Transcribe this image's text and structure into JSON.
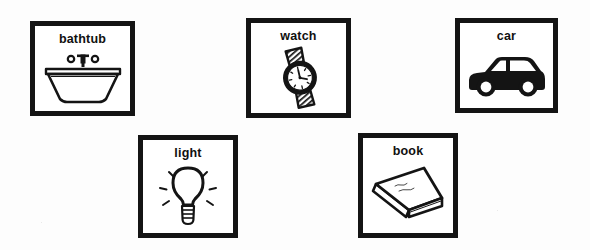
{
  "sheet": {
    "background_color": "#ffffff",
    "ink_color": "#141414",
    "description": "Picture-word flashcard worksheet with five framed illustration cards"
  },
  "cards": [
    {
      "id": "bathtub",
      "label": "bathtub",
      "icon": "bathtub-icon",
      "row": 1,
      "column": 1
    },
    {
      "id": "watch",
      "label": "watch",
      "icon": "watch-icon",
      "row": 1,
      "column": 2
    },
    {
      "id": "car",
      "label": "car",
      "icon": "car-icon",
      "row": 1,
      "column": 3
    },
    {
      "id": "light",
      "label": "light",
      "icon": "lightbulb-icon",
      "row": 2,
      "column": 1
    },
    {
      "id": "book",
      "label": "book",
      "icon": "book-icon",
      "row": 2,
      "column": 2
    }
  ]
}
